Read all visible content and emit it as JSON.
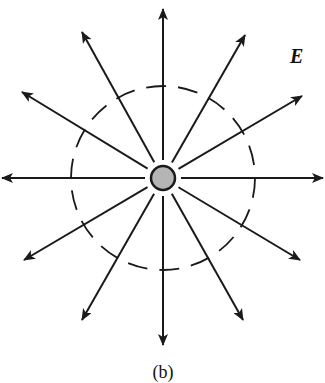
{
  "figure": {
    "caption": "(b)",
    "field_label": "E",
    "charge": {
      "cx": 163,
      "cy": 178,
      "r": 12,
      "fill": "#b5b5b5",
      "stroke": "#1a1a1a"
    },
    "gaussian_surface": {
      "cx": 163,
      "cy": 178,
      "r": 92,
      "style": "dashed"
    },
    "field_lines": [
      {
        "name": "up",
        "x2": 163,
        "y2": 9
      },
      {
        "name": "up-right",
        "x2": 245,
        "y2": 35
      },
      {
        "name": "right-up",
        "x2": 302,
        "y2": 96
      },
      {
        "name": "right",
        "x2": 323,
        "y2": 178
      },
      {
        "name": "right-down",
        "x2": 300,
        "y2": 260
      },
      {
        "name": "down-right",
        "x2": 243,
        "y2": 320
      },
      {
        "name": "down",
        "x2": 163,
        "y2": 345
      },
      {
        "name": "down-left",
        "x2": 82,
        "y2": 320
      },
      {
        "name": "left-down",
        "x2": 24,
        "y2": 260
      },
      {
        "name": "left",
        "x2": 2,
        "y2": 178
      },
      {
        "name": "left-up",
        "x2": 22,
        "y2": 92
      },
      {
        "name": "up-left",
        "x2": 82,
        "y2": 32
      }
    ],
    "colors": {
      "line": "#1a1a1a",
      "background": "#ffffff"
    }
  }
}
